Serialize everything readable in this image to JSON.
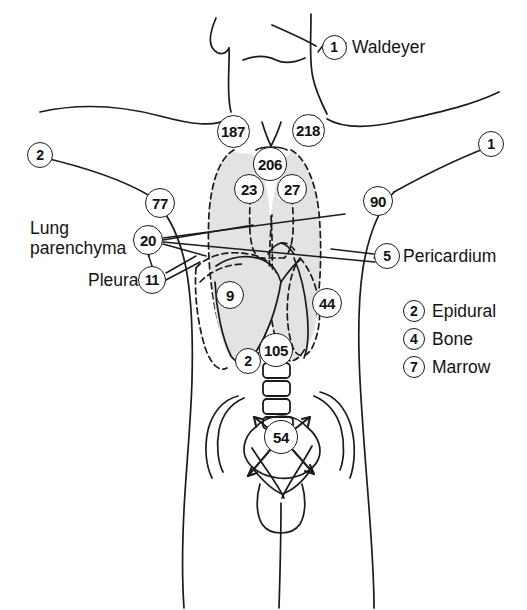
{
  "figure": {
    "organ_fill_color": "#e3e3e3",
    "line_color": "#1b1b1b",
    "background_color": "#ffffff"
  },
  "markers": [
    {
      "id": "waldeyer",
      "value": "1",
      "x": 334,
      "y": 47,
      "r": 12.5,
      "font": 14
    },
    {
      "id": "left-shoulder",
      "value": "2",
      "x": 40,
      "y": 155,
      "r": 13,
      "font": 14
    },
    {
      "id": "right-shoulder",
      "value": "1",
      "x": 491,
      "y": 144,
      "r": 13,
      "font": 14
    },
    {
      "id": "mediastinum-left",
      "value": "187",
      "x": 233,
      "y": 131,
      "r": 16.5,
      "font": 15
    },
    {
      "id": "mediastinum-right",
      "value": "218",
      "x": 308,
      "y": 130,
      "r": 16.5,
      "font": 15
    },
    {
      "id": "trachea",
      "value": "206",
      "x": 270,
      "y": 164,
      "r": 17,
      "font": 15
    },
    {
      "id": "hilum-left",
      "value": "23",
      "x": 249,
      "y": 189,
      "r": 15,
      "font": 15
    },
    {
      "id": "hilum-right",
      "value": "27",
      "x": 292,
      "y": 189,
      "r": 15,
      "font": 15
    },
    {
      "id": "axilla-left",
      "value": "77",
      "x": 160,
      "y": 203,
      "r": 15,
      "font": 15
    },
    {
      "id": "axilla-right",
      "value": "90",
      "x": 378,
      "y": 201,
      "r": 15,
      "font": 15
    },
    {
      "id": "lung-parenchyma",
      "value": "20",
      "x": 148,
      "y": 240,
      "r": 15,
      "font": 15
    },
    {
      "id": "pericardium",
      "value": "5",
      "x": 387,
      "y": 256,
      "r": 13,
      "font": 14
    },
    {
      "id": "pleura",
      "value": "11",
      "x": 152,
      "y": 280,
      "r": 14,
      "font": 14
    },
    {
      "id": "heart-left",
      "value": "9",
      "x": 230,
      "y": 295,
      "r": 14,
      "font": 15
    },
    {
      "id": "heart-right",
      "value": "44",
      "x": 327,
      "y": 303,
      "r": 15,
      "font": 15
    },
    {
      "id": "spinal-cord",
      "value": "105",
      "x": 276,
      "y": 350,
      "r": 17,
      "font": 15
    },
    {
      "id": "epidural-spine",
      "value": "2",
      "x": 248,
      "y": 361,
      "r": 13,
      "font": 14
    },
    {
      "id": "sacrum",
      "value": "54",
      "x": 281,
      "y": 437,
      "r": 17,
      "font": 15
    }
  ],
  "labels": [
    {
      "id": "waldeyer-label",
      "text": "Waldeyer",
      "x": 352,
      "y": 37,
      "align": "left"
    },
    {
      "id": "lung-parenchyma-label",
      "text": "Lung\nparenchyma",
      "x": 30,
      "y": 218,
      "align": "left"
    },
    {
      "id": "pleura-label",
      "text": "Pleura",
      "x": 88,
      "y": 270,
      "align": "left"
    },
    {
      "id": "pericardium-label",
      "text": "Pericardium",
      "x": 403,
      "y": 246,
      "align": "left"
    }
  ],
  "legend": {
    "x": 403,
    "y": 300,
    "items": [
      {
        "mark": "2",
        "text": "Epidural"
      },
      {
        "mark": "4",
        "text": "Bone"
      },
      {
        "mark": "7",
        "text": "Marrow"
      }
    ]
  },
  "chart_data": {
    "type": "diagram",
    "annotations": [
      {
        "label": "Waldeyer",
        "value": 1
      },
      {
        "label": "Left shoulder",
        "value": 2
      },
      {
        "label": "Right shoulder",
        "value": 1
      },
      {
        "label": "Mediastinum left",
        "value": 187
      },
      {
        "label": "Mediastinum right",
        "value": 218
      },
      {
        "label": "Trachea",
        "value": 206
      },
      {
        "label": "Hilum left",
        "value": 23
      },
      {
        "label": "Hilum right",
        "value": 27
      },
      {
        "label": "Axilla left",
        "value": 77
      },
      {
        "label": "Axilla right",
        "value": 90
      },
      {
        "label": "Lung parenchyma",
        "value": 20
      },
      {
        "label": "Pericardium",
        "value": 5
      },
      {
        "label": "Pleura",
        "value": 11
      },
      {
        "label": "Heart left",
        "value": 9
      },
      {
        "label": "Heart right",
        "value": 44
      },
      {
        "label": "Spinal cord",
        "value": 105
      },
      {
        "label": "Epidural spine",
        "value": 2
      },
      {
        "label": "Sacrum",
        "value": 54
      },
      {
        "label": "Epidural (legend)",
        "value": 2
      },
      {
        "label": "Bone (legend)",
        "value": 4
      },
      {
        "label": "Marrow (legend)",
        "value": 7
      }
    ]
  }
}
